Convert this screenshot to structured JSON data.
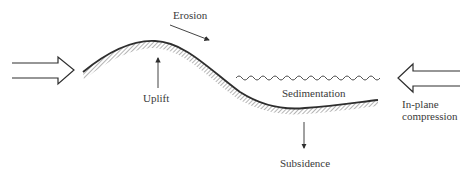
{
  "diagram": {
    "labels": {
      "erosion": "Erosion",
      "uplift": "Uplift",
      "sedimentation": "Sedimentation",
      "subsidence": "Subsidence",
      "compression_line1": "In-plane",
      "compression_line2": "compression"
    },
    "colors": {
      "stroke": "#2e2e2e",
      "text": "#3a3a3a",
      "background": "#ffffff"
    }
  }
}
